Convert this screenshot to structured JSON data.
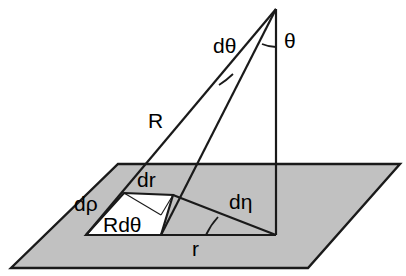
{
  "figure": {
    "type": "geometry-diagram",
    "canvas": {
      "width": 406,
      "height": 276
    },
    "colors": {
      "background": "#ffffff",
      "plane_fill": "#c1c1c1",
      "element_fill": "#ffffff",
      "stroke": "#1a1a1a",
      "text": "#000000"
    },
    "labels": [
      {
        "id": "d-theta",
        "text": "dθ",
        "x": 213,
        "y": 53,
        "size": 21,
        "name": "label-d-theta"
      },
      {
        "id": "theta",
        "text": "θ",
        "x": 284,
        "y": 48,
        "size": 21,
        "name": "label-theta"
      },
      {
        "id": "R",
        "text": "R",
        "x": 148,
        "y": 128,
        "size": 22,
        "name": "label-R"
      },
      {
        "id": "dr",
        "text": "dr",
        "x": 137,
        "y": 187,
        "size": 21,
        "name": "label-dr"
      },
      {
        "id": "d-rho",
        "text": "dρ",
        "x": 74,
        "y": 211,
        "size": 21,
        "name": "label-d-rho"
      },
      {
        "id": "Rdtheta",
        "text": "Rdθ",
        "x": 103,
        "y": 232,
        "size": 21,
        "name": "label-R-d-theta"
      },
      {
        "id": "d-eta",
        "text": "dη",
        "x": 229,
        "y": 209,
        "size": 21,
        "name": "label-d-eta"
      },
      {
        "id": "r",
        "text": "r",
        "x": 192,
        "y": 256,
        "size": 21,
        "name": "label-r"
      }
    ],
    "geometry": {
      "ground_plane": {
        "name": "ground-plane",
        "points": "118,164 400,164 308,268 11,268",
        "fill": "#c1c1c1"
      },
      "area_element": {
        "name": "area-element-patch",
        "points": "124,193 173,195 161,235 86,235",
        "fill": "#ffffff"
      },
      "apex": {
        "x": 276,
        "y": 9
      },
      "foot": {
        "x": 276,
        "y": 235
      },
      "R_outer_end": {
        "x": 86,
        "y": 235
      },
      "R_inner_end": {
        "x": 161,
        "y": 235
      },
      "dr_outer_end": {
        "x": 124,
        "y": 193
      },
      "dr_inner_end": {
        "x": 173,
        "y": 195
      }
    }
  }
}
